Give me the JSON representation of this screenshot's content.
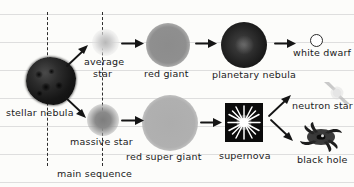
{
  "diagram": {
    "background": "ruled-notebook-paper",
    "paper_color": "#fcfcfa",
    "rule_color": "#dedede",
    "ink_color": "#1a1a1a"
  },
  "guides": {
    "main_sequence_label": "main sequence",
    "dashed_lines": 2
  },
  "labels": {
    "stellar_nebula": "stellar nebula",
    "average_star_line1": "average",
    "average_star_line2": "star",
    "red_giant": "red giant",
    "planetary_nebula": "planetary nebula",
    "white_dwarf": "white dwarf",
    "massive_star": "massive star",
    "red_super_giant": "red super giant",
    "supernova": "supernova",
    "neutron_star": "neutron star",
    "black_hole": "black hole"
  },
  "objects": [
    {
      "id": "stellar-nebula",
      "label": "stellar nebula",
      "shape": "dark-irregular-blob",
      "color": "#1a1a1a"
    },
    {
      "id": "average-star",
      "label": "average star",
      "shape": "small-faint-glow",
      "color": "#c4c4c4"
    },
    {
      "id": "red-giant",
      "label": "red giant",
      "shape": "medium-gray-sphere",
      "color": "#8c8c8c"
    },
    {
      "id": "planetary-nebula",
      "label": "planetary nebula",
      "shape": "dark-textured-sphere",
      "color": "#2a2a2a"
    },
    {
      "id": "white-dwarf",
      "label": "white dwarf",
      "shape": "small-open-circle",
      "color": "#ffffff"
    },
    {
      "id": "massive-star",
      "label": "massive star",
      "shape": "gray-glow-sphere",
      "color": "#8a8a8a"
    },
    {
      "id": "red-super-giant",
      "label": "red super giant",
      "shape": "large-light-sphere",
      "color": "#b0b0b0"
    },
    {
      "id": "supernova",
      "label": "supernova",
      "shape": "starburst-in-black-square",
      "color": "#0b0b0b"
    },
    {
      "id": "neutron-star",
      "label": "neutron star",
      "shape": "pulsar-beams",
      "color": "#cccccc"
    },
    {
      "id": "black-hole",
      "label": "black hole",
      "shape": "dark-accretion-disc",
      "color": "#1c1c1c"
    }
  ],
  "flow": [
    {
      "from": "stellar-nebula",
      "to": "average-star"
    },
    {
      "from": "average-star",
      "to": "red-giant"
    },
    {
      "from": "red-giant",
      "to": "planetary-nebula"
    },
    {
      "from": "planetary-nebula",
      "to": "white-dwarf"
    },
    {
      "from": "stellar-nebula",
      "to": "massive-star"
    },
    {
      "from": "massive-star",
      "to": "red-super-giant"
    },
    {
      "from": "red-super-giant",
      "to": "supernova"
    },
    {
      "from": "supernova",
      "to": "neutron-star"
    },
    {
      "from": "supernova",
      "to": "black-hole"
    }
  ]
}
